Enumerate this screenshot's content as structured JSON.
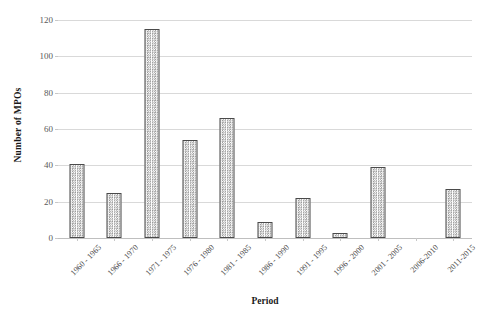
{
  "chart_data": {
    "type": "bar",
    "title": "",
    "xlabel": "Period",
    "ylabel": "Number of MPOs",
    "categories": [
      "1960 - 1965",
      "1966 - 1970",
      "1971 - 1975",
      "1976 - 1980",
      "1981 - 1985",
      "1986 - 1990",
      "1991 - 1995",
      "1996 - 2000",
      "2001 - 2005",
      "2006-2010",
      "2011-2015"
    ],
    "values": [
      41,
      25,
      115,
      54,
      66,
      9,
      22,
      3,
      39,
      0,
      27
    ],
    "ylim": [
      0,
      120
    ],
    "yticks": [
      0,
      20,
      40,
      60,
      80,
      100,
      120
    ],
    "ytick_labels": [
      "0",
      "20",
      "40",
      "60",
      "80",
      "100",
      "120"
    ],
    "grid": true,
    "grid_axis": "y",
    "legend": false,
    "bar_fill": "#f2f2f2",
    "bar_pattern": "dotted-checker",
    "bar_border_color": "#4a4a4a",
    "gridline_color": "#d9d9d9",
    "axis_text_color": "#4d4d4d",
    "title_text_color": "#1a1a1a",
    "background": "#ffffff"
  }
}
